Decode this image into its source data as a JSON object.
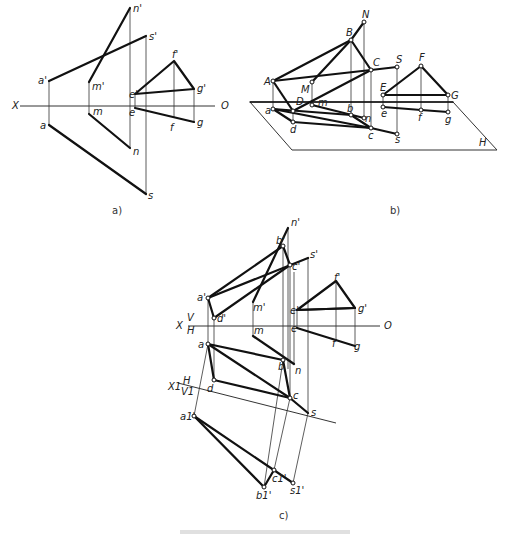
{
  "diagram": {
    "panels": [
      {
        "id": "a",
        "caption": "a)"
      },
      {
        "id": "b",
        "caption": "b)"
      },
      {
        "id": "c",
        "caption": "c)"
      }
    ],
    "panel_a": {
      "axis_left": "X",
      "axis_right": "O",
      "labels": {
        "n_prime": "n'",
        "s_prime": "s'",
        "a_prime": "a'",
        "m_prime": "m'",
        "e_prime": "e'",
        "f_prime": "f'",
        "g_prime": "g'",
        "m": "m",
        "e": "e",
        "a": "a",
        "f": "f",
        "g": "g",
        "n": "n",
        "s": "s"
      }
    },
    "panel_b": {
      "plane": "H",
      "labels": {
        "N": "N",
        "B": "B",
        "C": "C",
        "S": "S",
        "F": "F",
        "A": "A",
        "M": "M",
        "E": "E",
        "G": "G",
        "D": "D",
        "m": "m",
        "a": "a",
        "b": "b",
        "n": "n",
        "e": "e",
        "f": "f",
        "g": "g",
        "d": "d",
        "c": "c",
        "s": "s"
      }
    },
    "panel_c": {
      "axis_left": "X",
      "axis_right": "O",
      "upper_plane": "V",
      "lower_plane": "H",
      "aux_axis": "X1",
      "aux_upper": "H",
      "aux_lower": "V1",
      "labels": {
        "n_prime": "n'",
        "b_prime": "b'",
        "c_prime": "c'",
        "s_prime": "s'",
        "a_prime": "a'",
        "m_prime": "m'",
        "d_prime": "d'",
        "e_prime": "e'",
        "f_prime": "f'",
        "g_prime": "g'",
        "m": "m",
        "e": "e",
        "f": "f",
        "g": "g",
        "a": "a",
        "b": "b",
        "n": "n",
        "d": "d",
        "c": "c",
        "s": "s",
        "a1_prime": "a1'",
        "b1_prime": "b1'",
        "c1_prime": "c1'",
        "s1_prime": "s1'"
      }
    }
  }
}
